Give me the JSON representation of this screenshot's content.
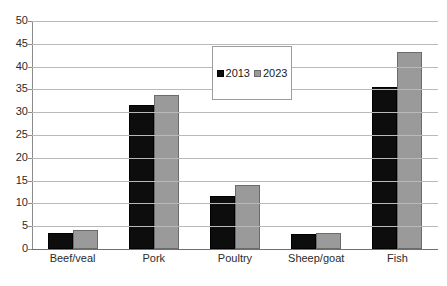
{
  "chart_data": {
    "type": "bar",
    "title": "",
    "xlabel": "",
    "ylabel": "",
    "ylim": [
      0,
      50
    ],
    "ytick_step": 5,
    "yticks": [
      "50",
      "45",
      "40",
      "35",
      "30",
      "25",
      "20",
      "15",
      "10",
      "5",
      "0"
    ],
    "grid": true,
    "legend_position": "upper center",
    "categories": [
      "Beef/veal",
      "Pork",
      "Poultry",
      "Sheep/goat",
      "Fish"
    ],
    "series": [
      {
        "name": "2013",
        "color": "#0d0d0d",
        "values": [
          3.5,
          31.5,
          11.6,
          3.3,
          35.5
        ]
      },
      {
        "name": "2023",
        "color": "#9a9a9a",
        "values": [
          4.2,
          33.7,
          14.1,
          3.6,
          43.3
        ]
      }
    ]
  },
  "legend": {
    "entries": [
      {
        "label": "2013",
        "swatch": "black-square-swatch"
      },
      {
        "label": "2023",
        "swatch": "gray-square-swatch"
      }
    ]
  },
  "title_sliver": {
    "text": ""
  }
}
